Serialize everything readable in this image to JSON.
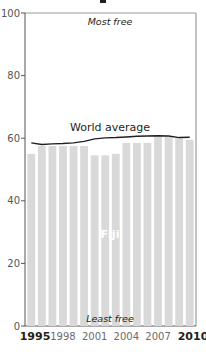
{
  "chart_data": {
    "type": "bar",
    "title": "",
    "xlabel": "",
    "ylabel": "",
    "ylim": [
      0,
      100
    ],
    "yticks": [
      0,
      20,
      40,
      60,
      80,
      100
    ],
    "categories": [
      "1995",
      "1996",
      "1997",
      "1998",
      "1999",
      "2000",
      "2001",
      "2002",
      "2003",
      "2004",
      "2005",
      "2006",
      "2007",
      "2008",
      "2009",
      "2010"
    ],
    "xtick_labels": [
      "1995",
      "1998",
      "2001",
      "2004",
      "2007",
      "2010"
    ],
    "series": [
      {
        "name": "Fiji",
        "type": "bar",
        "color": "#d9d9d9",
        "values": [
          55.0,
          57.5,
          57.5,
          57.5,
          57.5,
          57.5,
          54.5,
          54.5,
          55.0,
          58.5,
          58.5,
          58.5,
          60.5,
          60.5,
          60.0,
          59.5
        ]
      },
      {
        "name": "World average",
        "type": "line",
        "color": "#231f20",
        "values": [
          58.5,
          58.0,
          58.2,
          58.3,
          58.5,
          59.0,
          59.8,
          60.1,
          60.2,
          60.4,
          60.6,
          60.7,
          60.8,
          60.7,
          60.2,
          60.3
        ]
      }
    ],
    "annotations": {
      "top": "Most free",
      "bottom": "Least free"
    },
    "grid": false,
    "legend": "inline labels"
  },
  "labels": {
    "y_ticks": [
      "100",
      "80",
      "60",
      "40",
      "20",
      "0"
    ],
    "x_ticks": [
      "1995",
      "1998",
      "2001",
      "2004",
      "2007",
      "2010"
    ],
    "most_free": "Most free",
    "least_free": "Least free",
    "world_average": "World average",
    "fiji": "Fiji"
  }
}
